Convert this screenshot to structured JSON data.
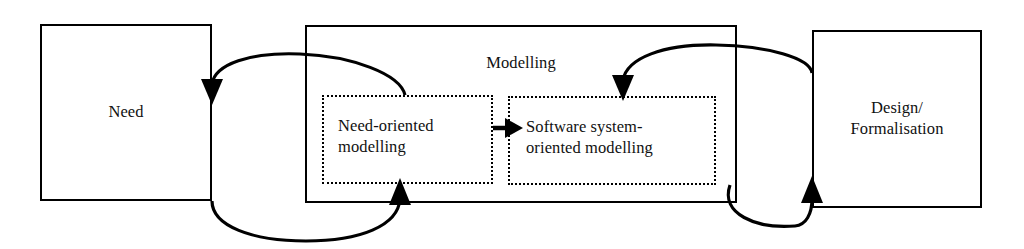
{
  "diagram": {
    "background_color": "#ffffff",
    "line_color": "#000000",
    "text_color": "#111111",
    "nodes": {
      "need": {
        "label": "Need",
        "border_style": "solid"
      },
      "modelling": {
        "label": "Modelling",
        "border_style": "solid"
      },
      "need_oriented": {
        "label": "Need-oriented\nmodelling",
        "border_style": "dotted"
      },
      "software_system": {
        "label": "Software system-\noriented modelling",
        "border_style": "dotted"
      },
      "design": {
        "label": "Design/\nFormalisation",
        "border_style": "solid"
      }
    },
    "edges": [
      {
        "name": "need-oriented-to-need",
        "from": "need_oriented",
        "to": "need",
        "shape": "curve-over-top",
        "arrowhead": "down"
      },
      {
        "name": "need-to-need-oriented",
        "from": "need",
        "to": "need_oriented",
        "shape": "curve-under-bottom",
        "arrowhead": "up"
      },
      {
        "name": "need-oriented-to-software-system",
        "from": "need_oriented",
        "to": "software_system",
        "shape": "straight",
        "arrowhead": "right"
      },
      {
        "name": "design-to-software-system",
        "from": "design",
        "to": "software_system",
        "shape": "curve-over-top",
        "arrowhead": "down"
      },
      {
        "name": "software-system-to-design",
        "from": "software_system",
        "to": "design",
        "shape": "curve-under-bottom",
        "arrowhead": "up"
      }
    ]
  }
}
